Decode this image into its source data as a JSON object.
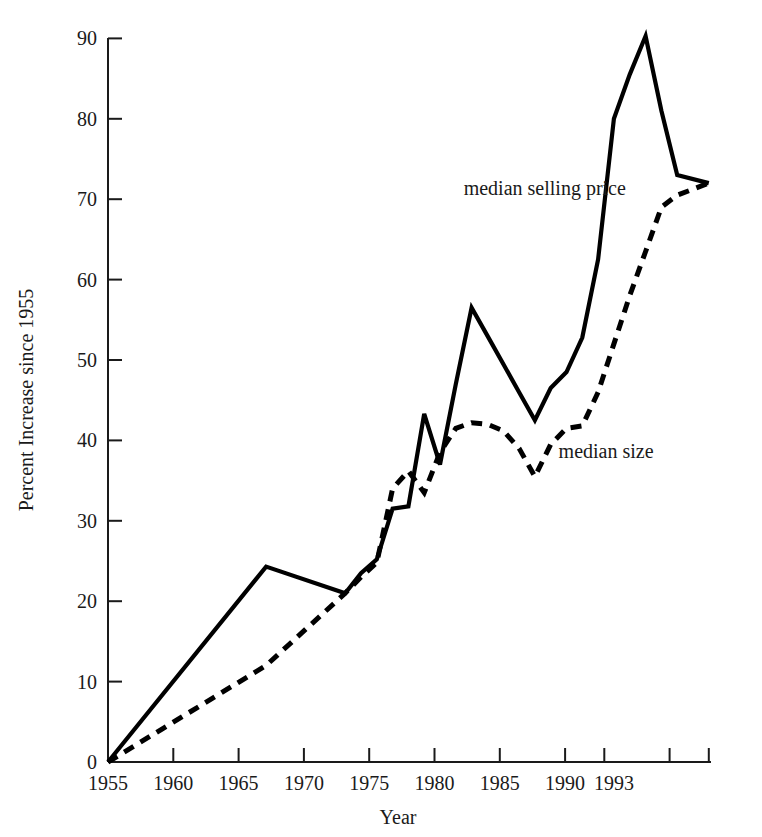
{
  "chart_data": {
    "type": "line",
    "title": "",
    "xlabel": "Year",
    "ylabel": "Percent Increase since 1955",
    "xlim": [
      1955,
      1993
    ],
    "ylim": [
      0,
      90
    ],
    "grid": false,
    "legend_position": "inline-annotations",
    "xticks": [
      1955,
      1960,
      1965,
      1970,
      1975,
      1980,
      1985,
      1990,
      1993
    ],
    "xtick_labels": [
      "1955",
      "1960",
      "1965",
      "1970",
      "1975",
      "1980",
      "1985",
      "1990",
      "1993"
    ],
    "yticks": [
      0,
      10,
      20,
      30,
      40,
      50,
      60,
      70,
      80,
      90
    ],
    "ytick_labels": [
      "0",
      "10",
      "20",
      "30",
      "40",
      "50",
      "60",
      "70",
      "80",
      "90"
    ],
    "x": [
      1955,
      1965,
      1970,
      1971,
      1972,
      1973,
      1974,
      1975,
      1976,
      1977,
      1978,
      1979,
      1980,
      1981,
      1982,
      1983,
      1984,
      1985,
      1986,
      1987,
      1988,
      1989,
      1990,
      1991,
      1993
    ],
    "series": [
      {
        "name": "median selling price",
        "style": "solid",
        "values": [
          0,
          24.3,
          21,
          23.5,
          25.2,
          31.5,
          31.8,
          43.3,
          37.0,
          47.0,
          56.5,
          53.0,
          49.5,
          46.0,
          42.5,
          46.5,
          48.5,
          52.8,
          62.5,
          80.0,
          85.5,
          90.3,
          81.0,
          73.0,
          72.0
        ]
      },
      {
        "name": "median size",
        "style": "dashed",
        "values": [
          0,
          12.0,
          21.0,
          23.0,
          24.8,
          34.0,
          36.2,
          33.5,
          38.5,
          41.5,
          42.2,
          42.0,
          41.2,
          39.0,
          35.5,
          39.5,
          41.5,
          41.8,
          46.0,
          52.0,
          58.0,
          63.5,
          69.0,
          70.5,
          72.0
        ]
      }
    ],
    "annotations": [
      {
        "text": "median selling price",
        "x": 1977.5,
        "y": 70.5
      },
      {
        "text": "median size",
        "x": 1983.5,
        "y": 37.8
      }
    ]
  },
  "labels": {
    "ylabel": "Percent Increase since 1955",
    "xlabel": "Year",
    "series_price": "median selling price",
    "series_size": "median size"
  },
  "ytick_0": "0",
  "ytick_10": "10",
  "ytick_20": "20",
  "ytick_30": "30",
  "ytick_40": "40",
  "ytick_50": "50",
  "ytick_60": "60",
  "ytick_70": "70",
  "ytick_80": "80",
  "ytick_90": "90",
  "xtick_1955": "1955",
  "xtick_1960": "1960",
  "xtick_1965": "1965",
  "xtick_1970": "1970",
  "xtick_1975": "1975",
  "xtick_1980": "1980",
  "xtick_1985": "1985",
  "xtick_1990": "1990",
  "xtick_1993": "1993"
}
